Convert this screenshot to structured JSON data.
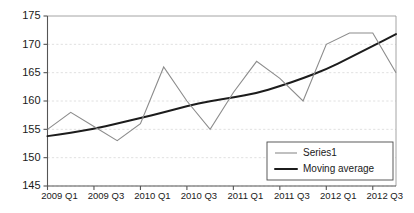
{
  "chart_data": {
    "type": "line",
    "title": "",
    "xlabel": "",
    "ylabel": "",
    "ylim": [
      145,
      175
    ],
    "ytick_values": [
      145,
      150,
      155,
      160,
      165,
      170,
      175
    ],
    "ytick_labels": [
      "145",
      "150",
      "155",
      "160",
      "165",
      "170",
      "175"
    ],
    "grid": true,
    "grid_axis": "y",
    "legend_position": "bottom-right",
    "x": [
      "2009 Q1",
      "2009 Q2",
      "2009 Q3",
      "2009 Q4",
      "2010 Q1",
      "2010 Q2",
      "2010 Q3",
      "2010 Q4",
      "2011 Q1",
      "2011 Q2",
      "2011 Q3",
      "2011 Q4",
      "2012 Q1",
      "2012 Q2",
      "2012 Q3",
      "2012 Q4"
    ],
    "xtick_labels": [
      "2009 Q1",
      "2009 Q3",
      "2010 Q1",
      "2010 Q3",
      "2011 Q1",
      "2011 Q3",
      "2012 Q1",
      "2012 Q3"
    ],
    "xtick_indices": [
      0,
      2,
      4,
      6,
      8,
      10,
      12,
      14
    ],
    "series": [
      {
        "name": "Series1",
        "color": "#8c8c8c",
        "width": 1.1,
        "values": [
          155,
          158,
          155.5,
          153,
          156,
          166,
          160,
          155,
          161.5,
          167,
          164,
          160,
          170,
          172,
          172,
          165
        ]
      },
      {
        "name": "Moving average",
        "color": "#1c1c1c",
        "width": 2.0,
        "values": [
          153.8,
          154.4,
          155.1,
          156.0,
          157.0,
          158.0,
          159.1,
          160.0,
          160.6,
          161.4,
          162.6,
          164.0,
          165.6,
          167.6,
          169.7,
          171.8
        ]
      }
    ],
    "legend": [
      {
        "label": "Series1",
        "color": "#8c8c8c",
        "width": 1.1
      },
      {
        "label": "Moving average",
        "color": "#1c1c1c",
        "width": 2.0
      }
    ]
  },
  "colors": {
    "background": "#ffffff",
    "grid": "#dcdcdc",
    "axis": "#555555",
    "text": "#1a1a1a",
    "series1": "#8c8c8c",
    "moving_average": "#1c1c1c"
  }
}
